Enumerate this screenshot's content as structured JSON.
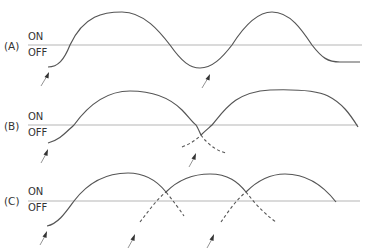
{
  "figure": {
    "panels": [
      {
        "id": "A",
        "label": "(A)",
        "on_label": "ON",
        "off_label": "OFF",
        "description": "Single oscillation: two full ON peaks separated by an OFF trough, then returns to OFF plateau",
        "arrows": 2
      },
      {
        "id": "B",
        "label": "(B)",
        "on_label": "ON",
        "off_label": "OFF",
        "description": "First ON wave declines (dashed below threshold) while a second overlapping wave rises (dashed from below threshold) and stays ON longer",
        "arrows": 2
      },
      {
        "id": "C",
        "label": "(C)",
        "on_label": "ON",
        "off_label": "OFF",
        "description": "Three successive overlapping ON waves; each declining wave continues dashed below threshold as the next wave rises",
        "arrows": 3
      }
    ],
    "colors": {
      "curve": "#555555",
      "baseline": "#b5b5b5",
      "text": "#333333",
      "arrow": "#333333"
    }
  }
}
